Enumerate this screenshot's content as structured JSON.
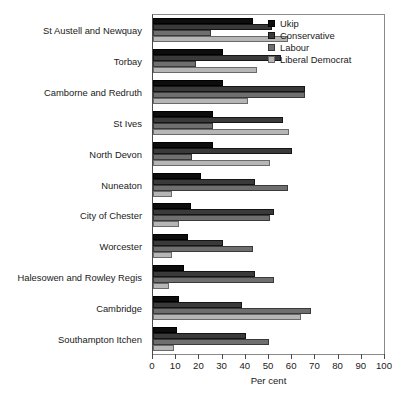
{
  "chart_data": {
    "type": "bar",
    "orientation": "horizontal",
    "title": "",
    "xlabel": "Per cent",
    "ylabel": "",
    "xlim": [
      0,
      100
    ],
    "xticks": [
      0,
      10,
      20,
      30,
      40,
      50,
      60,
      70,
      80,
      90,
      100
    ],
    "grid": false,
    "legend_position": "top-right",
    "categories": [
      "St Austell and Newquay",
      "Torbay",
      "Camborne and Redruth",
      "St Ives",
      "North Devon",
      "Nuneaton",
      "City of Chester",
      "Worcester",
      "Halesowen and Rowley Regis",
      "Cambridge",
      "Southampton Itchen"
    ],
    "series": [
      {
        "name": "Ukip",
        "color": "#0d0d0d",
        "values": [
          43,
          30,
          30,
          26,
          26,
          20.5,
          16.5,
          15,
          13.5,
          11,
          10.5
        ]
      },
      {
        "name": "Conservative",
        "color": "#3a3a3a",
        "values": [
          51.5,
          55,
          65.5,
          56,
          60,
          44,
          52,
          30,
          44,
          38.5,
          40
        ]
      },
      {
        "name": "Labour",
        "color": "#6f6f6f",
        "values": [
          25,
          18.5,
          65.5,
          26,
          17,
          58,
          50.5,
          43,
          52,
          68,
          50
        ]
      },
      {
        "name": "Liberal Democrat",
        "color": "#b6b6b6",
        "values": [
          58,
          45,
          41,
          58.5,
          50.5,
          8,
          11,
          8,
          7,
          64,
          9
        ]
      }
    ]
  },
  "legend": {
    "items": [
      {
        "label": "Ukip",
        "key": "ukip"
      },
      {
        "label": "Conservative",
        "key": "conservative"
      },
      {
        "label": "Labour",
        "key": "labour"
      },
      {
        "label": "Liberal Democrat",
        "key": "libdem"
      }
    ]
  }
}
